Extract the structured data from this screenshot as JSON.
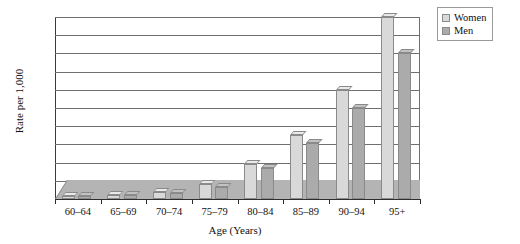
{
  "chart_data": {
    "type": "bar",
    "title": "",
    "xlabel": "Age (Years)",
    "ylabel": "Rate per 1,000",
    "categories": [
      "60–64",
      "65–69",
      "70–74",
      "75–79",
      "80–84",
      "85–89",
      "90–94",
      "95+"
    ],
    "series": [
      {
        "name": "Women",
        "color": "#d9d9d9",
        "values": [
          8,
          12,
          20,
          40,
          95,
          175,
          300,
          500
        ]
      },
      {
        "name": "Men",
        "color": "#ababab",
        "values": [
          7,
          10,
          17,
          32,
          85,
          155,
          250,
          400
        ]
      }
    ],
    "ylim": [
      0,
      500
    ],
    "yticks": [
      0,
      50,
      100,
      150,
      200,
      250,
      300,
      350,
      400,
      450,
      500
    ],
    "ytick_labels": [
      "0",
      "50",
      "100",
      "150",
      "200",
      "250",
      "300",
      "350",
      "400",
      "450",
      "500"
    ],
    "grid": true,
    "legend_position": "top-right",
    "legend_entries": [
      "Women",
      "Men"
    ]
  }
}
